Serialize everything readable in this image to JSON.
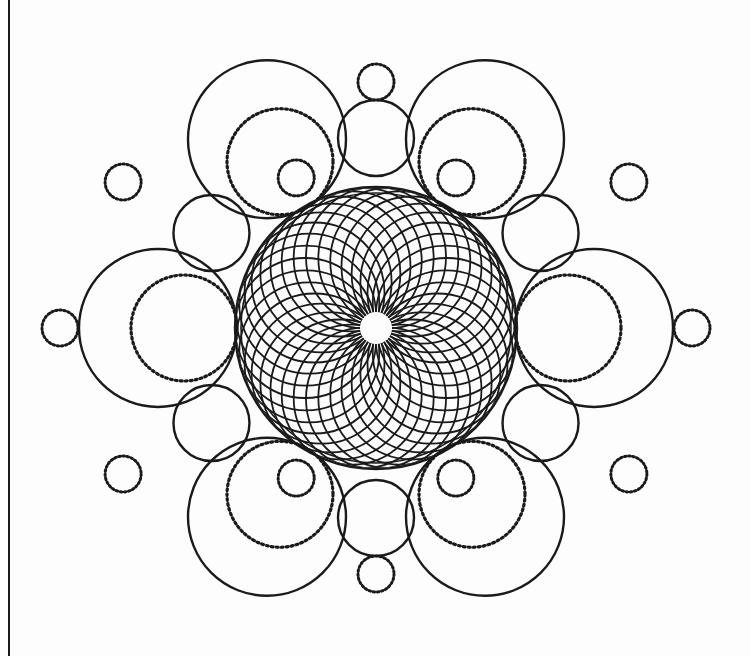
{
  "artwork": {
    "title": "Geometric Circle Mandala",
    "description": "Six-fold symmetric mandala of overlapping circles with a central spirograph rosette",
    "background_color": "#fdfdfd",
    "stroke_color": "#1a1a1a",
    "canvas": {
      "width": 751,
      "height": 656
    }
  },
  "page_border": {
    "name": "left-page-edge",
    "x": 8,
    "color": "#1a1a1a",
    "width": 2,
    "visible": true
  },
  "center": {
    "x": 376,
    "y": 328
  },
  "rosette": {
    "name": "central-spirograph-rosette",
    "outer_radius": 141,
    "ring_circle_count": 36,
    "ring_circle_radius": 70,
    "ring_center_radius": 71,
    "eye_radius": 16,
    "stroke_width": 1.8,
    "rim_circles": [
      {
        "radius": 141,
        "stroke_width": 2.4
      },
      {
        "radius": 135,
        "stroke_width": 1.6
      }
    ]
  },
  "large_circles": {
    "name": "large-outer-circles",
    "count": 6,
    "radius": 79,
    "orbit_radius": 218,
    "start_angle_deg": 0,
    "stroke_width": 2.4,
    "inner_dotted": {
      "name": "large-circle-inner-dotted",
      "radius": 53,
      "offset_toward_center": 26,
      "stroke_width": 3.2,
      "dash": "1.8 3.2"
    },
    "angles_deg": [
      0,
      60,
      120,
      180,
      240,
      300
    ]
  },
  "medium_circles": {
    "name": "medium-outer-circles",
    "count": 6,
    "radius": 38,
    "orbit_radius": 190,
    "start_angle_deg": 30,
    "stroke_width": 2.4,
    "angles_deg": [
      30,
      90,
      150,
      210,
      270,
      330
    ]
  },
  "small_dotted_circles": {
    "name": "small-dotted-satellites",
    "count": 12,
    "radius": 18,
    "stroke_width": 3.0,
    "dash": "1.6 2.6",
    "satellites": [
      {
        "angle_deg": 90,
        "orbit_radius": 246,
        "label": "top"
      },
      {
        "angle_deg": 30,
        "orbit_radius": 292,
        "label": "upper-right"
      },
      {
        "angle_deg": 150,
        "orbit_radius": 292,
        "label": "upper-left"
      },
      {
        "angle_deg": 0,
        "orbit_radius": 316,
        "label": "right"
      },
      {
        "angle_deg": 180,
        "orbit_radius": 316,
        "label": "left"
      },
      {
        "angle_deg": 330,
        "orbit_radius": 292,
        "label": "lower-right"
      },
      {
        "angle_deg": 210,
        "orbit_radius": 292,
        "label": "lower-left"
      },
      {
        "angle_deg": 270,
        "orbit_radius": 246,
        "label": "bottom"
      },
      {
        "angle_deg": 62,
        "orbit_radius": 170,
        "label": "inner-upper-right"
      },
      {
        "angle_deg": 118,
        "orbit_radius": 170,
        "label": "inner-upper-left"
      },
      {
        "angle_deg": 242,
        "orbit_radius": 170,
        "label": "inner-lower-left"
      },
      {
        "angle_deg": 298,
        "orbit_radius": 170,
        "label": "inner-lower-right"
      }
    ]
  }
}
